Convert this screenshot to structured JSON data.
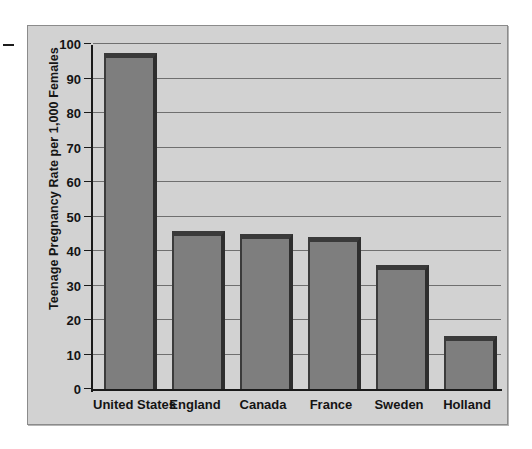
{
  "figure": {
    "background_color": "#d2d2d2",
    "frame_color": "#8b8b8b",
    "bar_fill_color": "#7e7e7e",
    "bar_edge_color": "#2e2e2e",
    "gridline_color": "#6f6f6f",
    "axis_color": "#1a1a1a",
    "text_color": "#141414"
  },
  "chart_data": {
    "type": "bar",
    "title": "",
    "xlabel": "",
    "ylabel": "Teenage Pregnancy Rate per 1,000 Females",
    "categories": [
      "United States",
      "England",
      "Canada",
      "France",
      "Sweden",
      "Holland"
    ],
    "values": [
      97.3,
      45.8,
      45.0,
      44.0,
      36.0,
      15.3
    ],
    "ylim": [
      0,
      100
    ],
    "ytick_labels": [
      "0",
      "10",
      "20",
      "30",
      "40",
      "50",
      "60",
      "70",
      "80",
      "90",
      "100"
    ],
    "ytick_values": [
      0,
      10,
      20,
      30,
      40,
      50,
      60,
      70,
      80,
      90,
      100
    ],
    "grid": true,
    "grid_axis": "y",
    "legend": false,
    "legend_position": "none",
    "orientation": "vertical"
  }
}
